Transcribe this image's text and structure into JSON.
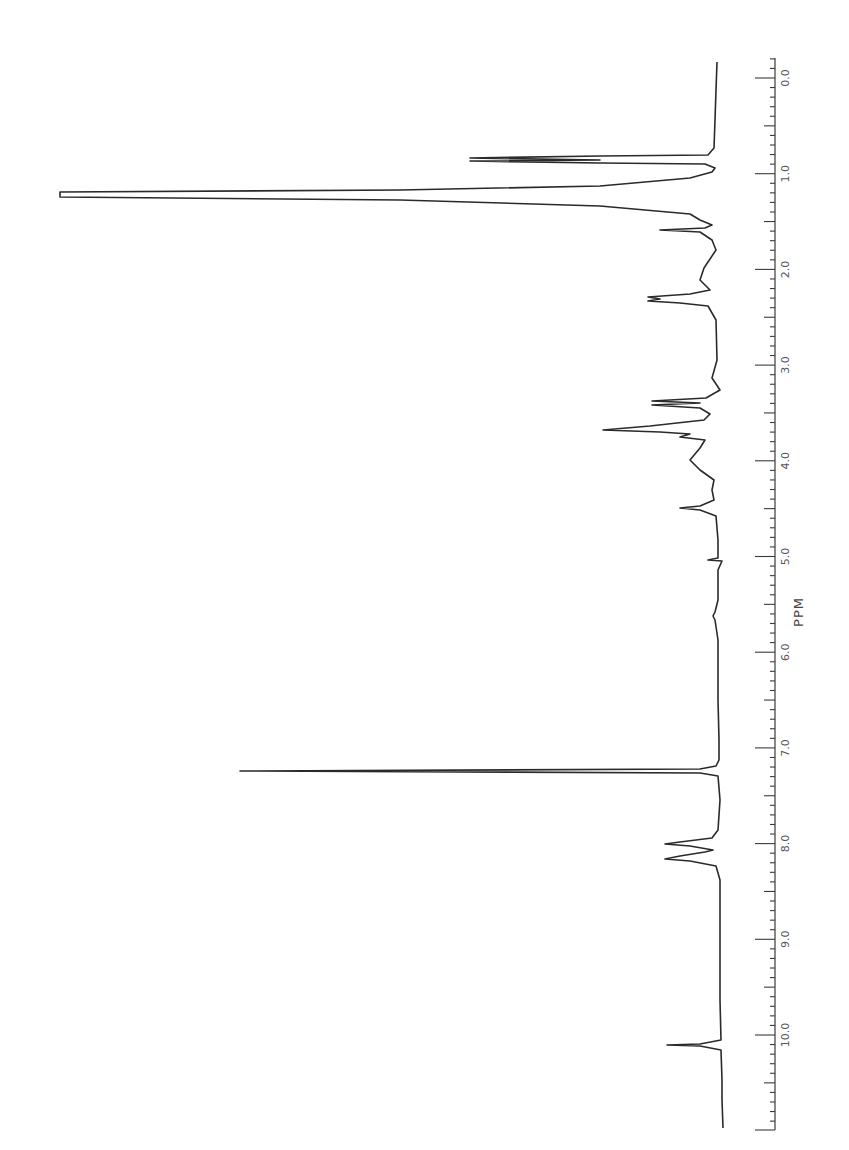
{
  "chart_data": {
    "type": "line",
    "title": "",
    "xlabel": "PPM",
    "ylabel": "",
    "orientation": "rotated-90-clockwise",
    "xlim": [
      11.0,
      0.0
    ],
    "grid": false,
    "legend": null,
    "tick_labels": [
      "0.0",
      "1.0",
      "2.0",
      "3.0",
      "4.0",
      "5.0",
      "6.0",
      "7.0",
      "8.0",
      "9.0",
      "10.0"
    ],
    "tick_values": [
      0,
      1,
      2,
      3,
      4,
      5,
      6,
      7,
      8,
      9,
      10
    ],
    "peaks": [
      {
        "ppm": 0.85,
        "relative_intensity": 0.36,
        "label": "triplet"
      },
      {
        "ppm": 1.25,
        "relative_intensity": 1.0,
        "label": "tall doublet (off-scale)"
      },
      {
        "ppm": 1.55,
        "relative_intensity": 0.08
      },
      {
        "ppm": 2.28,
        "relative_intensity": 0.1
      },
      {
        "ppm": 2.35,
        "relative_intensity": 0.09
      },
      {
        "ppm": 3.38,
        "relative_intensity": 0.1
      },
      {
        "ppm": 3.45,
        "relative_intensity": 0.1
      },
      {
        "ppm": 3.7,
        "relative_intensity": 0.17
      },
      {
        "ppm": 3.8,
        "relative_intensity": 0.06
      },
      {
        "ppm": 4.5,
        "relative_intensity": 0.06
      },
      {
        "ppm": 5.6,
        "relative_intensity": 0.01
      },
      {
        "ppm": 7.26,
        "relative_intensity": 0.72,
        "label": "CHCl3 solvent"
      },
      {
        "ppm": 7.95,
        "relative_intensity": 0.08
      },
      {
        "ppm": 8.12,
        "relative_intensity": 0.08
      },
      {
        "ppm": 10.1,
        "relative_intensity": 0.08
      }
    ],
    "trace_points": "717,62 716,90 715,120 714,148 708,155 600,156 470,158 600,160 470,161 600,163 705,164 715,168 712,172 690,178 600,186 400,190 60,192 60,197 400,200 600,206 690,214 700,220 712,225 705,228 660,230 700,232 712,240 716,250 704,268 700,280 710,290 690,294 648,297 660,299 648,301 680,303 708,306 716,320 717,360 712,378 720,390 706,398 652,401 700,403 652,405 700,408 710,414 704,420 650,426 603,430 660,432 690,434 680,437 705,440 700,448 690,460 700,470 714,480 712,490 714,500 700,506 680,508 700,510 716,516 718,540 718,558 708,560 722,561 718,570 718,600 715,612 713,616 715,620 718,640 718,700 719,740 719,760 716,766 700,769 240,771 700,773 718,776 720,800 718,830 712,838 680,842 665,844 690,846 713,850 705,852 680,856 665,859 690,861 716,866 720,880 720,950 720,1000 721,1040 700,1044 667,1045 700,1046 721,1050 722,1080 722,1100 723,1128",
    "axis": {
      "x_position": 775,
      "px_per_ppm": 95.7,
      "zero_ppm_y": 78,
      "top_y": 58,
      "bottom_y": 1130
    }
  }
}
